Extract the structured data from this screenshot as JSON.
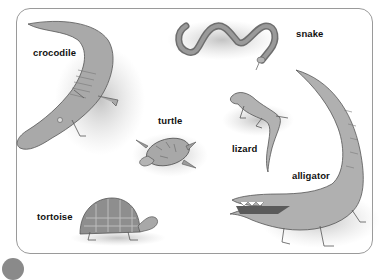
{
  "figure": {
    "kind": "labeled illustration of reptiles",
    "frame_color": "#9a9a9a",
    "animals": [
      {
        "id": "crocodile",
        "label": "crocodile"
      },
      {
        "id": "snake",
        "label": "snake"
      },
      {
        "id": "turtle",
        "label": "turtle"
      },
      {
        "id": "lizard",
        "label": "lizard"
      },
      {
        "id": "alligator",
        "label": "alligator"
      },
      {
        "id": "tortoise",
        "label": "tortoise"
      }
    ]
  }
}
